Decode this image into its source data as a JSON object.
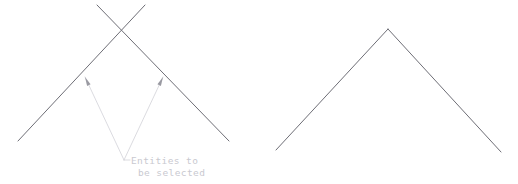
{
  "canvas": {
    "width": 518,
    "height": 184,
    "background_color": "#ffffff",
    "title": "Entities to be selected"
  },
  "colors": {
    "entity_stroke": "#6e6e76",
    "leader_stroke": "#d2d2d8",
    "text_fill": "#c9c9d0"
  },
  "strokes": {
    "entity_width": 1.0,
    "leader_width": 0.8
  },
  "left_figure": {
    "name": "crossing-lines-before",
    "lines": [
      {
        "id": "line-a",
        "label": "first-entity-line",
        "x1": 18,
        "y1": 141,
        "x2": 145,
        "y2": 5
      },
      {
        "id": "line-b",
        "label": "second-entity-line",
        "x1": 97,
        "y1": 5,
        "x2": 229,
        "y2": 141
      }
    ],
    "intersection": {
      "x": 125,
      "y": 31
    }
  },
  "right_figure": {
    "name": "chevron-result-after",
    "lines": [
      {
        "id": "line-c",
        "label": "trimmed-left-segment",
        "x1": 276,
        "y1": 150,
        "x2": 388,
        "y2": 29
      },
      {
        "id": "line-d",
        "label": "trimmed-right-segment",
        "x1": 388,
        "y1": 29,
        "x2": 501,
        "y2": 152
      }
    ],
    "apex": {
      "x": 388,
      "y": 29
    }
  },
  "annotation": {
    "name": "entities-to-be-selected-callout",
    "vertex": {
      "x": 124,
      "y": 160
    },
    "leaders": [
      {
        "id": "leader-left",
        "label": "leader-to-left-entity",
        "from_x": 124,
        "from_y": 160,
        "to_x": 85,
        "to_y": 77,
        "arrow_angle_deg": 245
      },
      {
        "id": "leader-right",
        "label": "leader-to-right-entity",
        "from_x": 124,
        "from_y": 160,
        "to_x": 163,
        "to_y": 77,
        "arrow_angle_deg": 295
      }
    ],
    "text_lines": [
      {
        "text": "Entities to",
        "x": 131,
        "y": 164
      },
      {
        "text": "be selected",
        "x": 138,
        "y": 176
      }
    ],
    "font_size": 9.5
  }
}
